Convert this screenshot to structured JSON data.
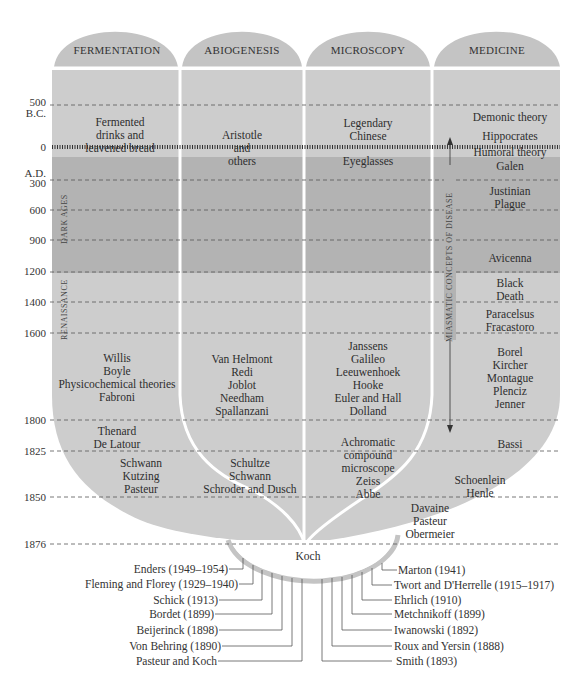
{
  "columns": [
    {
      "id": "fermentation",
      "title": "FERMENTATION"
    },
    {
      "id": "abiogenesis",
      "title": "ABIOGENESIS"
    },
    {
      "id": "microscopy",
      "title": "MICROSCOPY"
    },
    {
      "id": "medicine",
      "title": "MEDICINE"
    }
  ],
  "timeline": {
    "y500bc": "500",
    "bc": "B.C.",
    "y0": "0",
    "ad": "A.D.",
    "y300": "300",
    "y600": "600",
    "y900": "900",
    "y1200": "1200",
    "y1400": "1400",
    "y1600": "1600",
    "y1800": "1800",
    "y1825": "1825",
    "y1850": "1850",
    "y1876": "1876"
  },
  "eras": {
    "dark_ages": "DARK AGES",
    "renaissance": "RENAISSANCE",
    "miasmatic": "MIASMATIC CONCEPTS OF DISEASE"
  },
  "fermentation": {
    "ancient": "Fermented drinks and leavened bread",
    "c1600_1800": [
      "Willis",
      "Boyle",
      "Physicochemical theories",
      "Fabroni"
    ],
    "c1800_1825": [
      "Thenard",
      "De Latour"
    ],
    "c1825_1850": [
      "Schwann",
      "Kutzing",
      "Pasteur"
    ]
  },
  "abiogenesis": {
    "ancient": [
      "Aristotle",
      "and",
      "others"
    ],
    "c1600_1800": [
      "Van Helmont",
      "Redi",
      "Joblot",
      "Needham",
      "Spallanzani"
    ],
    "c1825_1850": [
      "Schultze",
      "Schwann",
      "Schroder and Dusch"
    ]
  },
  "microscopy": {
    "ancient": [
      "Legendary",
      "Chinese"
    ],
    "ad": "Eyeglasses",
    "c1600_1800": [
      "Janssens",
      "Galileo",
      "Leeuwenhoek",
      "Hooke",
      "Euler and Hall",
      "Dolland"
    ],
    "c1800_1850": [
      "Achromatic",
      "compound",
      "microscope"
    ],
    "c1825_1850": [
      "Zeiss",
      "Abbe"
    ]
  },
  "medicine": {
    "demonic": "Demonic theory",
    "hippocrates": "Hippocrates",
    "humoral": "Humoral theory",
    "galen": "Galen",
    "justinian": [
      "Justinian",
      "Plague"
    ],
    "avicenna": "Avicenna",
    "black_death": [
      "Black",
      "Death"
    ],
    "c1400_1600": [
      "Paracelsus",
      "Fracastoro"
    ],
    "c1600_1800": [
      "Borel",
      "Kircher",
      "Montague",
      "Plenciz",
      "Jenner"
    ],
    "bassi": "Bassi",
    "c1825_1850": [
      "Schoenlein",
      "Henle"
    ],
    "c1850_1876": [
      "Davaine",
      "Pasteur",
      "Obermeier"
    ]
  },
  "convergence": "Koch",
  "left_branches": [
    "Enders (1949–1954)",
    "Fleming and Florey (1929–1940)",
    "Schick (1913)",
    "Bordet (1899)",
    "Beijerinck (1898)",
    "Von Behring (1890)",
    "Pasteur and Koch"
  ],
  "right_branches": [
    "Marton (1941)",
    "Twort and D'Herrelle (1915–1917)",
    "Ehrlich (1910)",
    "Metchnikoff (1899)",
    "Iwanowski (1892)",
    "Roux and Yersin (1888)",
    "Smith (1893)"
  ],
  "colors": {
    "light_grey": "#cdcdcd",
    "dark_grey": "#b3b3b3",
    "header_grey": "#c4c4c4",
    "line": "#555555"
  }
}
